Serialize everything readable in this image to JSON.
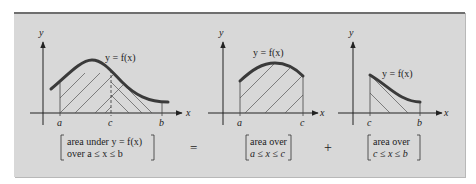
{
  "diagram": {
    "colors": {
      "panel": "#d8d8d8",
      "border": "#6f6f6f",
      "curve": "#3a3a3a",
      "hatch": "#555555",
      "axis": "#222222"
    },
    "graph1": {
      "y_label": "y",
      "x_label": "x",
      "curve_label": "y = f(x)",
      "ticks": [
        "a",
        "c",
        "b"
      ],
      "caption_line1": "area under y = f(x)",
      "caption_line2": "over a ≤ x ≤ b"
    },
    "operator1": "=",
    "graph2": {
      "y_label": "y",
      "x_label": "x",
      "curve_label": "y = f(x)",
      "ticks": [
        "a",
        "c"
      ],
      "caption_line1": "area over",
      "caption_line2": "a ≤ x ≤ c"
    },
    "operator2": "+",
    "graph3": {
      "y_label": "y",
      "x_label": "x",
      "curve_label": "y = f(x)",
      "ticks": [
        "c",
        "b"
      ],
      "caption_line1": "area over",
      "caption_line2": "c ≤ x ≤ b"
    }
  }
}
